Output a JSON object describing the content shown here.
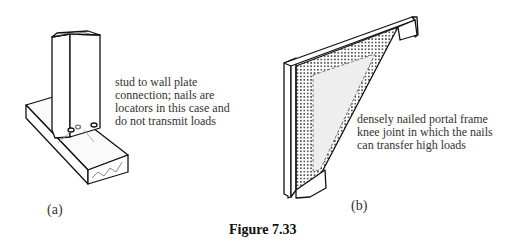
{
  "figure": {
    "title": "Figure 7.33",
    "panels": [
      {
        "label": "(a)",
        "description_lines": [
          "stud to wall plate",
          "connection; nails are",
          "locators in this case and",
          "do not transmit loads"
        ]
      },
      {
        "label": "(b)",
        "description_lines": [
          "densely nailed portal frame",
          "knee joint in which the nails",
          "can transfer high loads"
        ]
      }
    ]
  }
}
